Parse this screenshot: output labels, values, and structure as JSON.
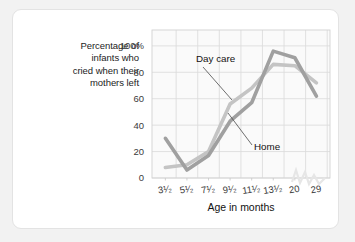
{
  "chart_data": {
    "type": "line",
    "title": "",
    "xlabel": "Age in months",
    "ylabel": "Percentage of infants who cried when their mothers left",
    "ylabel_lines": [
      "Percentage of",
      "infants who",
      "cried when their",
      "mothers left"
    ],
    "categories": [
      "3¹/₂",
      "5¹/₂",
      "7¹/₂",
      "9¹/₂",
      "11¹/₂",
      "13¹/₂",
      "20",
      "29"
    ],
    "xtick_labels": [
      "3¹⁄₂",
      "5¹⁄₂",
      "7¹⁄₂",
      "9¹⁄₂",
      "11¹⁄₂",
      "13¹⁄₂",
      "20",
      "29"
    ],
    "ytick_labels": [
      "0",
      "20",
      "40",
      "60",
      "80",
      "100%"
    ],
    "ytick_values": [
      0,
      20,
      40,
      60,
      80,
      100
    ],
    "ylim": [
      0,
      112
    ],
    "grid": true,
    "legend": "inline-annotations",
    "series": [
      {
        "name": "Day care",
        "color": "#c4c4c4",
        "values": [
          8,
          10,
          20,
          56,
          68,
          86,
          85,
          72
        ]
      },
      {
        "name": "Home",
        "color": "#a0a0a0",
        "values": [
          30,
          6,
          17,
          43,
          57,
          96,
          91,
          62
        ]
      }
    ],
    "annotations": [
      {
        "text": "Day care",
        "target_series": "Day care"
      },
      {
        "text": "Home",
        "target_series": "Home"
      }
    ]
  }
}
